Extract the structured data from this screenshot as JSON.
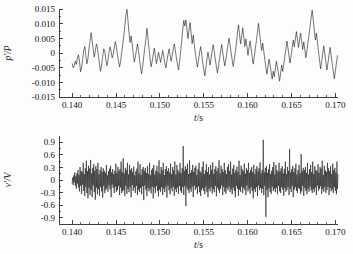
{
  "figure": {
    "background_color": "#fdfdfd",
    "line_color": "#1a1a1a",
    "axis_color": "#2a2a2a"
  },
  "chart_data": [
    {
      "id": "pressure-fluctuation",
      "type": "line",
      "title": "",
      "xlabel": "t/s",
      "ylabel": "p'/P",
      "xlim": [
        0.1385,
        0.1703
      ],
      "ylim": [
        -0.015,
        0.015
      ],
      "xticks": [
        0.14,
        0.145,
        0.15,
        0.155,
        0.16,
        0.165,
        0.17
      ],
      "xtick_labels": [
        "0.140",
        "0.145",
        "0.150",
        "0.155",
        "0.160",
        "0.165",
        "0.170"
      ],
      "yticks": [
        0.015,
        0.01,
        0.005,
        0,
        -0.005,
        -0.01,
        -0.015
      ],
      "ytick_labels": [
        "0.015",
        "0.010",
        "0.005",
        "0",
        "-0.005",
        "-0.010",
        "-0.015"
      ],
      "x_minor_count": 5,
      "y_minor_count": 2,
      "grid": false,
      "legend": null,
      "x_start": 0.14,
      "x_step": 0.00012,
      "values": [
        -0.0037,
        -0.0051,
        -0.0043,
        -0.0027,
        -0.0039,
        -0.0018,
        -0.0006,
        -0.0031,
        -0.0064,
        -0.0048,
        -0.0021,
        0.0009,
        0.0022,
        -0.0008,
        -0.0037,
        -0.0019,
        0.0014,
        0.0042,
        0.0069,
        0.0041,
        0.0012,
        -0.0014,
        0.0007,
        0.0031,
        0.0018,
        -0.0011,
        -0.0039,
        -0.0062,
        -0.0041,
        -0.0012,
        0.0014,
        0.0006,
        -0.0023,
        -0.0043,
        -0.0026,
        0.0002,
        0.0021,
        0.0006,
        -0.0017,
        -0.0004,
        0.0018,
        0.0039,
        0.0021,
        -0.0006,
        -0.0026,
        -0.0047,
        -0.0029,
        0.0001,
        0.0026,
        0.0057,
        0.0091,
        0.0128,
        0.0149,
        0.0111,
        0.0068,
        0.0036,
        0.0058,
        0.0031,
        -0.0002,
        -0.0031,
        -0.0014,
        0.0009,
        0.0031,
        0.0008,
        -0.0021,
        -0.0052,
        -0.0071,
        -0.0044,
        -0.0013,
        0.0018,
        0.0046,
        0.0084,
        0.0051,
        0.0014,
        -0.0018,
        -0.0047,
        -0.0029,
        -0.0004,
        0.0016,
        -0.0009,
        -0.0036,
        -0.0018,
        0.0002,
        -0.0014,
        -0.0032,
        -0.0011,
        0.0009,
        -0.0013,
        -0.0034,
        -0.0051,
        -0.0028,
        -0.0006,
        0.0014,
        -0.0007,
        -0.0028,
        -0.0009,
        0.0012,
        0.0031,
        0.0009,
        -0.0016,
        -0.0038,
        -0.0058,
        -0.0031,
        0.0004,
        0.0038,
        0.0079,
        0.0111,
        0.0092,
        0.0113,
        0.0081,
        0.0049,
        0.0078,
        0.0104,
        0.0068,
        0.0032,
        0.0061,
        0.0029,
        -0.0002,
        -0.0026,
        -0.0048,
        -0.0024,
        0.0001,
        0.0022,
        -0.0004,
        -0.0031,
        -0.0058,
        -0.0078,
        -0.0051,
        -0.0022,
        0.0003,
        -0.0018,
        -0.0041,
        -0.0017,
        0.0008,
        0.0028,
        0.0004,
        -0.0023,
        -0.0046,
        -0.0068,
        -0.0044,
        -0.0019,
        0.0006,
        0.0029,
        0.0003,
        -0.0024,
        -0.0044,
        -0.0021,
        0.0004,
        0.0027,
        0.0051,
        0.0028,
        0.0001,
        -0.0024,
        -0.0046,
        -0.0022,
        0.0005,
        0.0034,
        0.0068,
        0.0096,
        0.0062,
        0.0031,
        0.0058,
        0.0086,
        0.0054,
        0.0022,
        0.0048,
        0.0021,
        -0.0008,
        0.0018,
        0.0041,
        0.0014,
        -0.0014,
        -0.0038,
        -0.0012,
        0.0016,
        0.0042,
        0.0071,
        0.0101,
        0.0069,
        0.0036,
        0.0009,
        0.0034,
        0.0006,
        -0.0022,
        -0.0048,
        -0.0072,
        -0.0046,
        -0.0021,
        -0.0042,
        -0.0066,
        -0.0089,
        -0.0062,
        -0.0081,
        -0.0054,
        -0.0028,
        -0.0049,
        -0.0071,
        -0.0096,
        -0.0069,
        -0.0041,
        -0.0063,
        -0.0038,
        -0.0012,
        0.0014,
        0.0041,
        0.0016,
        -0.0011,
        -0.0034,
        -0.0009,
        0.0018,
        0.0044,
        0.0021,
        0.0048,
        0.0073,
        0.0046,
        0.0019,
        0.0044,
        0.0068,
        0.0039,
        0.0012,
        0.0038,
        0.0011,
        -0.0016,
        0.0009,
        0.0036,
        0.0062,
        0.0091,
        0.0122,
        0.0146,
        0.0112,
        0.0078,
        0.0044,
        0.0068,
        0.0036,
        0.0004,
        -0.0026,
        -0.0054,
        -0.0029,
        -0.0002,
        0.0024,
        -0.0004,
        -0.0031,
        -0.0058,
        -0.0032,
        -0.0006,
        0.0019,
        -0.0009,
        -0.0036,
        -0.0061,
        -0.0088,
        -0.0062,
        -0.0034,
        -0.0009,
        0.0016,
        0.0044,
        0.0074,
        0.0109,
        0.0143,
        0.0106,
        0.0069,
        0.0034,
        0.0002,
        -0.0029,
        -0.0061,
        -0.0036,
        -0.0009,
        0.0018,
        0.0046,
        0.0022,
        -0.0004,
        0.0021,
        0.0049,
        0.0076,
        0.0048,
        0.0021,
        0.0046,
        0.0019,
        -0.0008,
        0.0017,
        0.0044,
        0.0018,
        -0.0009,
        0.0016,
        0.0041,
        0.0014,
        -0.0012,
        -0.0038,
        -0.0064,
        -0.0091,
        -0.0066,
        -0.0039,
        -0.0013,
        0.0012,
        0.0038,
        0.0012,
        -0.0014,
        -0.0041,
        -0.0016,
        0.0011,
        0.0036,
        0.0062,
        0.0034,
        0.0008,
        0.0032,
        0.0058,
        0.0031,
        0.0004,
        0.0029,
        0.0054,
        0.0026,
        -0.0002,
        -0.0028,
        -0.0006,
        0.0021,
        0.0048,
        0.0074,
        0.0046,
        0.0019,
        0.0042,
        0.0016,
        -0.0011,
        -0.0034,
        -0.0009,
        0.0018,
        0.0044,
        0.0069,
        0.0042,
        0.0014,
        0.0038,
        0.0062,
        0.0034,
        0.0008,
        0.0032,
        0.0054
      ]
    },
    {
      "id": "velocity-fluctuation",
      "type": "line",
      "title": "",
      "xlabel": "t/s",
      "ylabel": "v'/V",
      "xlim": [
        0.1385,
        0.1703
      ],
      "ylim": [
        -1.05,
        1.05
      ],
      "xticks": [
        0.14,
        0.145,
        0.15,
        0.155,
        0.16,
        0.165,
        0.17
      ],
      "xtick_labels": [
        "0.140",
        "0.145",
        "0.150",
        "0.155",
        "0.160",
        "0.165",
        "0.170"
      ],
      "yticks": [
        0.9,
        0.6,
        0.3,
        0,
        -0.3,
        -0.6,
        -0.9
      ],
      "ytick_labels": [
        "0.9",
        "0.6",
        "0.3",
        "0",
        "-0.3",
        "-0.6",
        "-0.9"
      ],
      "x_minor_count": 5,
      "y_minor_count": 2,
      "grid": false,
      "legend": null,
      "x_start": 0.14,
      "x_step": 6e-05,
      "values": [
        -0.08,
        0.06,
        -0.12,
        0.11,
        -0.05,
        0.18,
        -0.14,
        0.09,
        -0.21,
        0.16,
        -0.08,
        0.24,
        -0.18,
        0.12,
        -0.27,
        0.31,
        -0.14,
        0.22,
        -0.33,
        0.19,
        -0.11,
        0.41,
        -0.26,
        0.14,
        -0.38,
        0.28,
        -0.17,
        0.46,
        -0.31,
        0.21,
        -0.44,
        0.34,
        -0.19,
        0.27,
        -0.36,
        0.48,
        -0.24,
        0.16,
        -0.41,
        0.29,
        -0.13,
        0.38,
        -0.29,
        0.22,
        -0.47,
        0.33,
        -0.18,
        0.26,
        -0.34,
        0.41,
        -0.22,
        0.14,
        -0.38,
        0.24,
        -0.16,
        0.31,
        -0.27,
        0.19,
        -0.42,
        0.28,
        -0.14,
        0.22,
        -0.31,
        0.17,
        -0.24,
        0.36,
        -0.19,
        0.11,
        -0.28,
        0.21,
        -0.13,
        0.27,
        -0.22,
        0.34,
        -0.41,
        0.18,
        -0.11,
        0.26,
        -0.19,
        0.14,
        -0.31,
        0.22,
        -0.16,
        0.39,
        -0.28,
        0.17,
        -0.24,
        0.31,
        -0.14,
        0.22,
        -0.36,
        0.26,
        -0.18,
        0.44,
        -0.31,
        0.19,
        -0.27,
        0.52,
        -0.24,
        0.16,
        -0.38,
        0.29,
        -0.14,
        0.24,
        -0.33,
        0.41,
        -0.21,
        0.13,
        -0.29,
        0.36,
        -0.17,
        0.24,
        -0.41,
        0.28,
        -0.12,
        0.19,
        -0.26,
        0.32,
        -0.18,
        0.11,
        -0.31,
        0.21,
        -0.14,
        0.27,
        -0.36,
        0.44,
        -0.23,
        0.16,
        -0.29,
        0.38,
        -0.19,
        0.12,
        -0.34,
        0.26,
        -0.15,
        0.31,
        -0.48,
        0.22,
        -0.13,
        0.29,
        -0.24,
        0.17,
        -0.38,
        0.33,
        -0.19,
        0.14,
        -0.27,
        0.41,
        -0.21,
        0.11,
        -0.32,
        0.24,
        -0.16,
        0.28,
        -0.44,
        0.36,
        -0.18,
        0.13,
        -0.31,
        0.22,
        -0.14,
        0.34,
        -0.26,
        0.19,
        -0.39,
        0.47,
        -0.23,
        0.15,
        -0.28,
        0.31,
        -0.17,
        0.24,
        -0.36,
        0.41,
        -0.21,
        0.12,
        -0.29,
        0.26,
        -0.16,
        0.33,
        -0.42,
        0.21,
        -0.13,
        0.28,
        -0.24,
        0.18,
        -0.34,
        0.39,
        -0.19,
        0.14,
        -0.27,
        0.31,
        -0.16,
        0.23,
        -0.38,
        0.44,
        -0.22,
        0.13,
        -0.29,
        0.36,
        -0.18,
        0.24,
        -0.33,
        0.19,
        -0.14,
        0.41,
        -0.26,
        0.16,
        -0.31,
        0.28,
        -0.17,
        0.81,
        -0.36,
        0.22,
        -0.14,
        0.33,
        -0.62,
        0.26,
        -0.18,
        0.39,
        -0.24,
        0.14,
        -0.31,
        0.47,
        -0.21,
        0.17,
        -0.28,
        0.24,
        -0.16,
        0.36,
        -0.41,
        0.19,
        -0.13,
        0.29,
        -0.24,
        0.34,
        -0.18,
        0.12,
        -0.33,
        0.26,
        -0.15,
        0.41,
        -0.29,
        0.21,
        -0.38,
        0.17,
        -0.24,
        0.31,
        -0.19,
        0.44,
        -0.26,
        0.14,
        -0.34,
        0.23,
        -0.16,
        0.38,
        -0.28,
        0.19,
        -0.41,
        0.31,
        -0.21,
        0.13,
        -0.27,
        0.36,
        -0.17,
        0.24,
        -0.32,
        0.42,
        -0.22,
        0.15,
        -0.29,
        0.26,
        -0.14,
        0.33,
        -0.39,
        0.21,
        -0.18,
        0.28,
        -0.24,
        0.47,
        -0.31,
        0.16,
        -0.21,
        0.34,
        -0.13,
        0.26,
        -0.36,
        0.19,
        -0.17,
        0.41,
        -0.28,
        0.23,
        -0.33,
        0.14,
        -0.19,
        0.31,
        -0.24,
        0.38,
        -0.16,
        0.21,
        -0.29,
        0.44,
        -0.22,
        0.13,
        -0.34,
        0.27,
        -0.18,
        0.36,
        -0.26,
        0.17,
        -0.41,
        0.24,
        -0.14,
        0.32,
        -0.21,
        0.19,
        -0.38,
        0.46,
        -0.23,
        0.12,
        -0.28,
        0.34,
        -0.16,
        0.26,
        -0.31,
        0.21,
        -0.19,
        0.39,
        -0.24,
        0.15,
        -0.36,
        0.28,
        -0.13,
        0.23,
        -0.27,
        0.41,
        -0.21,
        0.17,
        -0.33,
        0.24,
        -0.18,
        0.31,
        -0.26,
        0.19,
        -0.44,
        0.36,
        -0.22,
        0.14,
        -0.29,
        0.26,
        -0.17,
        0.33,
        -0.38,
        0.21,
        -0.13,
        0.28,
        -0.24,
        0.42,
        -0.19,
        0.16,
        -0.31,
        0.24,
        -0.21,
        0.96,
        -0.36,
        0.18,
        -0.14,
        0.29,
        -0.88,
        0.33,
        -0.24,
        0.17,
        -0.41,
        0.26,
        -0.19,
        0.38,
        -0.28,
        0.14,
        -0.33,
        0.22,
        -0.16,
        0.31,
        -0.26,
        0.43,
        -0.21,
        0.13,
        -0.29,
        0.36,
        -0.18,
        0.24,
        -0.34,
        0.19,
        -0.14,
        0.41,
        -0.27,
        0.21,
        -0.31,
        0.28,
        -0.17,
        0.33,
        -0.23,
        0.16,
        -0.38,
        0.26,
        -0.19,
        0.44,
        -0.28,
        0.14,
        -0.24,
        0.31,
        -0.16,
        0.22,
        -0.36,
        0.74,
        -0.21,
        0.18,
        -0.29,
        0.26,
        -0.14,
        0.34,
        -0.41,
        0.19,
        -0.23,
        0.28,
        -0.17,
        0.39,
        -0.26,
        0.13,
        -0.31,
        0.24,
        -0.18,
        0.36,
        -0.22,
        0.16,
        -0.33,
        0.62,
        -0.27,
        0.21,
        -0.14,
        0.29,
        -0.38,
        0.24,
        -0.19,
        0.31,
        -0.26,
        0.17,
        -0.34,
        0.41,
        -0.21,
        0.13,
        -0.28,
        0.26,
        -0.16,
        0.36,
        -0.24,
        0.19,
        -0.31,
        0.44,
        -0.22,
        0.14,
        -0.29,
        0.33,
        -0.18,
        0.24,
        -0.36,
        0.21,
        -0.13,
        0.38,
        -0.26,
        0.17,
        -0.21,
        0.31,
        -0.15,
        0.27,
        -0.33,
        0.46,
        -0.22,
        0.12,
        -0.28,
        0.34,
        -0.17,
        0.23,
        -0.31,
        0.19,
        -0.24,
        0.41,
        -0.16,
        0.28,
        -0.36,
        0.21,
        -0.19,
        0.33,
        -0.27,
        0.14,
        -0.22,
        0.39,
        -0.31,
        0.24,
        -0.17,
        0.29,
        -0.26,
        0.18,
        -0.34,
        0.44,
        -0.21,
        0.13,
        -0.28,
        0.36
      ]
    }
  ]
}
